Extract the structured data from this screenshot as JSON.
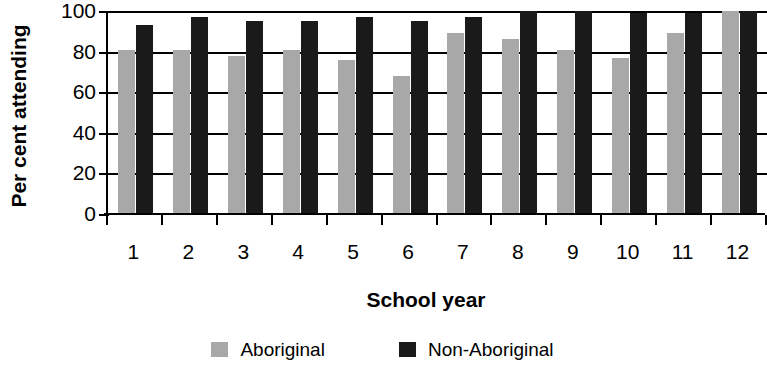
{
  "chart_data": {
    "type": "bar",
    "title": "",
    "xlabel": "School year",
    "ylabel": "Per cent attending",
    "categories": [
      "1",
      "2",
      "3",
      "4",
      "5",
      "6",
      "7",
      "8",
      "9",
      "10",
      "11",
      "12"
    ],
    "series": [
      {
        "name": "Aboriginal",
        "color": "#a8a8a8",
        "values": [
          81,
          81,
          78,
          81,
          76,
          68,
          89,
          86,
          81,
          77,
          89,
          100
        ]
      },
      {
        "name": "Non-Aboriginal",
        "color": "#1a1a1a",
        "values": [
          93,
          97,
          95,
          95,
          97,
          95,
          97,
          100,
          100,
          99,
          99,
          100
        ]
      }
    ],
    "ylim": [
      0,
      100
    ],
    "yticks": [
      0,
      20,
      40,
      60,
      80,
      100
    ],
    "ytick_labels": [
      "0",
      "20",
      "40",
      "60",
      "80",
      "100"
    ],
    "grid": "horizontal",
    "legend_position": "bottom"
  },
  "legend": {
    "items": [
      {
        "label": "Aboriginal",
        "swatch": "gray-swatch"
      },
      {
        "label": "Non-Aboriginal",
        "swatch": "black-swatch"
      }
    ]
  }
}
